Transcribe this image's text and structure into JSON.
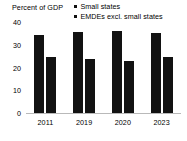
{
  "chart_data": {
    "type": "bar",
    "title": "Percent of GDP",
    "xlabel": "",
    "ylabel": "Percent of GDP",
    "categories": [
      "2011",
      "2019",
      "2020",
      "2023"
    ],
    "series": [
      {
        "name": "Small states",
        "values": [
          34.5,
          36.0,
          36.5,
          35.5
        ]
      },
      {
        "name": "EMDEs excl. small states",
        "values": [
          25.0,
          24.0,
          23.0,
          25.0
        ]
      }
    ],
    "ylim": [
      0,
      40
    ],
    "yticks": [
      "0",
      "10",
      "20",
      "30",
      "40"
    ],
    "ytick_values": [
      0,
      10,
      20,
      30,
      40
    ],
    "grid": false,
    "legend_position": "top-right",
    "colors": {
      "series_1": "#121212",
      "series_2": "#121212",
      "axis": "#b9b9b9",
      "text": "#000000",
      "background": "#ffffff"
    }
  },
  "legend": {
    "items": [
      {
        "label": "Small states",
        "marker": "square-marker"
      },
      {
        "label": "EMDEs excl. small states",
        "marker": "square-marker"
      }
    ]
  }
}
